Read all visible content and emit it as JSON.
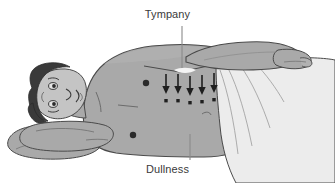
{
  "figure": {
    "type": "medical-illustration",
    "canvas": {
      "width": 335,
      "height": 183,
      "background": "#ffffff"
    },
    "colors": {
      "background": "#ffffff",
      "skin": "#a9a9a9",
      "skin_shadow": "#989898",
      "skin_highlight": "#b8b8b8",
      "sheet": "#ececec",
      "sheet_shadow": "#dcdcdc",
      "hair": "#3a3a3a",
      "outline": "#4a4a4a",
      "marker": "#2b2b2b",
      "label_text": "#3a3a3a",
      "leader_line": "#8a8a8a"
    },
    "labels": {
      "top": "Tympany",
      "bottom": "Dullness",
      "clipped_top": "p"
    },
    "annotations": {
      "percussion_arrows": {
        "name": "percussion-arrow-row",
        "count": 5,
        "direction": "down",
        "description": "Downward percussion arrows over the flank with dot markers beneath",
        "x_positions": [
          166,
          178,
          190,
          202,
          214
        ],
        "arrow_top_y": 74,
        "arrow_bottom_y": 92,
        "dot_y": 98
      },
      "body_markers": [
        {
          "name": "nipple-marker",
          "x": 146,
          "y": 83,
          "r": 3.2
        },
        {
          "name": "umbilicus-marker",
          "x": 133,
          "y": 135,
          "r": 3.2
        }
      ],
      "leader_lines": [
        {
          "name": "tympany-leader",
          "x1": 182,
          "y1": 26,
          "x2": 182,
          "y2": 72
        },
        {
          "name": "dullness-leader",
          "x1": 190,
          "y1": 134,
          "x2": 190,
          "y2": 160
        }
      ]
    },
    "parts": [
      {
        "name": "pillow",
        "label": "Pillow"
      },
      {
        "name": "head",
        "label": "Head"
      },
      {
        "name": "hair",
        "label": "Hair"
      },
      {
        "name": "face",
        "label": "Face"
      },
      {
        "name": "lower-arm",
        "label": "Lower arm"
      },
      {
        "name": "torso",
        "label": "Torso"
      },
      {
        "name": "upper-arm",
        "label": "Upper arm"
      },
      {
        "name": "hand",
        "label": "Hand"
      },
      {
        "name": "draping-sheet",
        "label": "Draping sheet"
      },
      {
        "name": "costal-margin-line",
        "label": "Costal margin"
      }
    ]
  }
}
